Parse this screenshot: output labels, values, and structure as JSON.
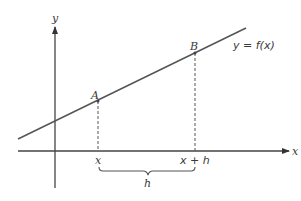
{
  "diagram": {
    "type": "secant-line-derivative",
    "colors": {
      "line": "#555555",
      "axis": "#444444",
      "text": "#3a3a3a",
      "background": "#ffffff"
    },
    "axes": {
      "x_label": "x",
      "y_label": "y"
    },
    "curve": {
      "label": "y = f(x)"
    },
    "points": [
      {
        "label": "A"
      },
      {
        "label": "B"
      }
    ],
    "ticks": [
      {
        "label": "x"
      },
      {
        "label": "x + h"
      }
    ],
    "brace": {
      "label": "h"
    }
  }
}
